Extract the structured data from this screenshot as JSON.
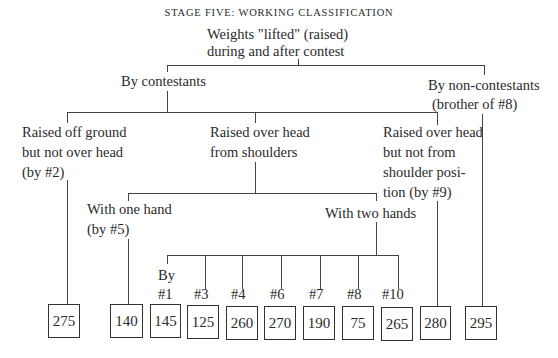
{
  "title": "STAGE FIVE: WORKING CLASSIFICATION",
  "root": {
    "line1": "Weights \"lifted\" (raised)",
    "line2": "during and after contest"
  },
  "level2": {
    "contestants": "By contestants",
    "non_contestants": {
      "line1": "By non-contestants",
      "line2": "(brother of #8)"
    }
  },
  "level3": {
    "off_ground": {
      "line1": "Raised off ground",
      "line2": "but not over head",
      "line3": "(by #2)"
    },
    "over_head_shoulders": {
      "line1": "Raised over head",
      "line2": "from shoulders"
    },
    "over_head_not_shoulders": {
      "line1": "Raised over head",
      "line2": "but not from",
      "line3": "shoulder posi-",
      "line4": "tion (by #9)"
    }
  },
  "level4": {
    "one_hand": {
      "line1": "With one hand",
      "line2": "(by #5)"
    },
    "two_hands": "With two hands"
  },
  "two_hand_contestants": {
    "by_label": "By",
    "items": [
      {
        "label": "#1",
        "weight": "145"
      },
      {
        "label": "#3",
        "weight": "125"
      },
      {
        "label": "#4",
        "weight": "260"
      },
      {
        "label": "#6",
        "weight": "270"
      },
      {
        "label": "#7",
        "weight": "190"
      },
      {
        "label": "#8",
        "weight": "75"
      },
      {
        "label": "#10",
        "weight": "265"
      }
    ]
  },
  "leaf_weights": {
    "off_ground": "275",
    "one_hand": "140",
    "not_from_shoulders": "280",
    "non_contestants": "295"
  }
}
